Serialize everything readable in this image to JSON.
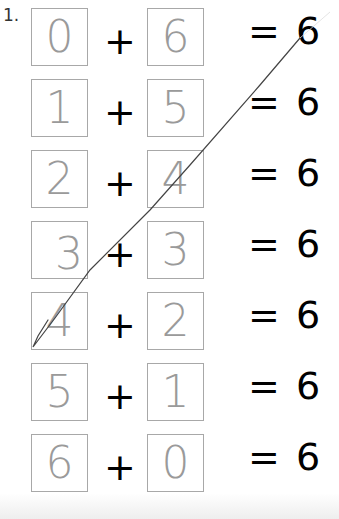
{
  "problem_number": "1.",
  "rows": [
    {
      "a": "0",
      "b": "6",
      "result": "= 6"
    },
    {
      "a": "1",
      "b": "5",
      "result": "= 6"
    },
    {
      "a": "2",
      "b": "4",
      "result": "= 6"
    },
    {
      "a": "3",
      "b": "3",
      "result": "= 6"
    },
    {
      "a": "4",
      "b": "2",
      "result": "= 6"
    },
    {
      "a": "5",
      "b": "1",
      "result": "= 6"
    },
    {
      "a": "6",
      "b": "0",
      "result": "= 6"
    }
  ],
  "operator": "+",
  "colors": {
    "box_border": "#a8a8a8",
    "handwriting": "#9a9a9a",
    "printed": "#000000",
    "pencil_line": "#444444"
  }
}
